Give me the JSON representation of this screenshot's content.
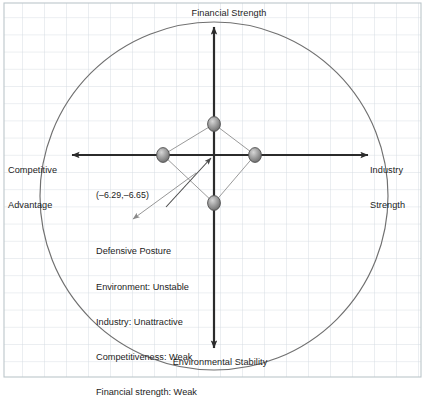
{
  "diagram": {
    "type": "space-matrix",
    "axes": {
      "top_label": "Financial Strength",
      "bottom_label": "Environmental Stability",
      "left_label": "Competitive\nAdvantage",
      "left_label_line1": "Competitive",
      "left_label_line2": "Advantage",
      "right_label": "Industry\nStrength",
      "right_label_line1": "Industry",
      "right_label_line2": "Strength"
    },
    "vector": {
      "coordinate_label": "(–6.29,–6.65)",
      "x": -6.29,
      "y": -6.65
    },
    "annotation": {
      "title": "Defensive Posture",
      "lines": [
        "Defensive Posture",
        "Environment: Unstable",
        "Industry: Unattractive",
        "Competitiveness: Weak",
        "Financial strength: Weak"
      ],
      "line1": "Defensive Posture",
      "line2": "Environment: Unstable",
      "line3": "Industry: Unattractive",
      "line4": "Competitiveness: Weak",
      "line5": "Financial strength: Weak"
    },
    "points": [
      {
        "name": "financial-strength-point",
        "cx": 214,
        "cy": 124
      },
      {
        "name": "competitive-advantage-point",
        "cx": 163,
        "cy": 155
      },
      {
        "name": "industry-strength-point",
        "cx": 255,
        "cy": 155
      },
      {
        "name": "environmental-stability-point",
        "cx": 214,
        "cy": 203
      }
    ],
    "colors": {
      "grid": "#cfd8dc",
      "border": "#b9c3c8",
      "circle": "#6e6e6e",
      "axis": "#2b2b2b",
      "polygon": "#8a8a8a",
      "point_fill": "#9b9b9b",
      "point_stroke": "#4a4a4a",
      "text": "#1c1c1c",
      "leader": "#8a8a8a"
    }
  }
}
